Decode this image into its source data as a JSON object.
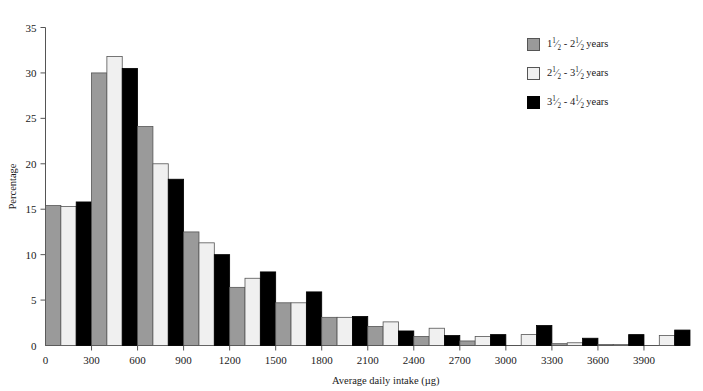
{
  "chart_data": {
    "type": "bar",
    "title": "",
    "xlabel": "Average daily intake (µg)",
    "ylabel": "Percentage",
    "ylim": [
      0,
      35
    ],
    "ytick_step": 5,
    "yticks": [
      "0",
      "5",
      "10",
      "15",
      "20",
      "25",
      "30",
      "35"
    ],
    "xlim": [
      0,
      4200
    ],
    "xtick_step": 300,
    "xticks": [
      "0",
      "300",
      "600",
      "900",
      "1200",
      "1500",
      "1800",
      "2100",
      "2400",
      "2700",
      "3000",
      "3300",
      "3600",
      "3900"
    ],
    "grid": false,
    "legend_position": "top-right",
    "bin_width": 300,
    "categories": [
      "0-300",
      "300-600",
      "600-900",
      "900-1200",
      "1200-1500",
      "1500-1800",
      "1800-2100",
      "2100-2400",
      "2400-2700",
      "2700-3000",
      "3000-3300",
      "3300-3600",
      "3600-3900",
      "3900-4200"
    ],
    "series": [
      {
        "name": "1½ - 2½ years",
        "color": "#9a9a9a",
        "values": [
          15.4,
          30.0,
          24.1,
          12.5,
          6.4,
          4.7,
          3.1,
          2.1,
          1.0,
          0.5,
          0.0,
          0.2,
          0.1,
          0.0
        ]
      },
      {
        "name": "2½ - 3½ years",
        "color": "#f0f0f0",
        "values": [
          15.3,
          31.8,
          20.0,
          11.3,
          7.4,
          4.7,
          3.1,
          2.6,
          1.9,
          1.0,
          1.2,
          0.3,
          0.1,
          1.1
        ]
      },
      {
        "name": "3½ - 4½ years",
        "color": "#000000",
        "values": [
          15.8,
          30.5,
          18.3,
          10.0,
          8.1,
          5.9,
          3.2,
          1.6,
          1.1,
          1.2,
          2.2,
          0.8,
          1.2,
          1.7
        ]
      }
    ]
  },
  "legend": {
    "items": [
      {
        "icon": "legend-swatch-gray",
        "whole_low": "1",
        "num_low": "1",
        "den_low": "2",
        "dash": "-",
        "whole_high": "2",
        "num_high": "1",
        "den_high": "2",
        "unit": "years"
      },
      {
        "icon": "legend-swatch-white",
        "whole_low": "2",
        "num_low": "1",
        "den_low": "2",
        "dash": "-",
        "whole_high": "3",
        "num_high": "1",
        "den_high": "2",
        "unit": "years"
      },
      {
        "icon": "legend-swatch-black",
        "whole_low": "3",
        "num_low": "1",
        "den_low": "2",
        "dash": "-",
        "whole_high": "4",
        "num_high": "1",
        "den_high": "2",
        "unit": "years"
      }
    ]
  },
  "colors": {
    "series_1": "#9a9a9a",
    "series_2": "#f0f0f0",
    "series_3": "#000000",
    "axis": "#555555",
    "text": "#1a1a1a",
    "background": "#ffffff"
  }
}
